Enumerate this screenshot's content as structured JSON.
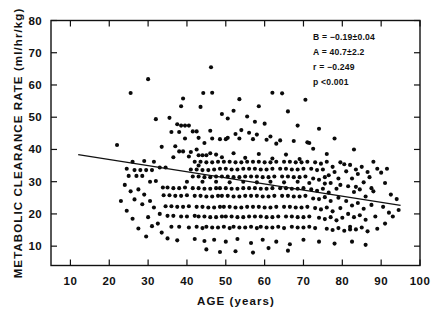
{
  "chart_data": {
    "type": "scatter",
    "title": "",
    "xlabel": "AGE (years)",
    "ylabel": "METABOLIC CLEARANCE RATE (ml/hr/kg)",
    "xlim": [
      5,
      100
    ],
    "ylim": [
      4,
      80
    ],
    "xticks": [
      10,
      20,
      30,
      40,
      50,
      60,
      70,
      80,
      90,
      100
    ],
    "yticks": [
      10,
      20,
      30,
      40,
      50,
      60,
      70,
      80
    ],
    "xtick_labels": [
      "10",
      "20",
      "30",
      "40",
      "50",
      "60",
      "70",
      "80",
      "90",
      "100"
    ],
    "ytick_labels": [
      "10",
      "20",
      "30",
      "40",
      "50",
      "60",
      "70",
      "80"
    ],
    "grid": false,
    "legend": null,
    "tick_direction": "in",
    "annotations": [
      "B  =  −0.19±0.04",
      "A  =  40.7±2.2",
      "r  =  −0.249",
      "p   <0.001"
    ],
    "fit": {
      "type": "linear",
      "slope": -0.19,
      "slope_err": 0.04,
      "intercept": 40.7,
      "intercept_err": 2.2,
      "r": -0.249,
      "p": "<0.001",
      "x_start": 12,
      "x_end": 95
    },
    "marker": {
      "shape": "circle",
      "color": "#0a0a0a",
      "size_px": 3.0
    },
    "n_points": 372,
    "points": [
      [
        22.0,
        41.4
      ],
      [
        25.5,
        57.5
      ],
      [
        30.0,
        61.8
      ],
      [
        32.0,
        49.4
      ],
      [
        46.2,
        65.5
      ],
      [
        39.0,
        55.8
      ],
      [
        38.5,
        53.4
      ],
      [
        44.2,
        57.5
      ],
      [
        46.5,
        57.6
      ],
      [
        43.5,
        53.2
      ],
      [
        35.5,
        49.8
      ],
      [
        37.5,
        47.8
      ],
      [
        38.5,
        47.4
      ],
      [
        39.5,
        47.4
      ],
      [
        40.5,
        47.4
      ],
      [
        36.0,
        45.4
      ],
      [
        38.0,
        45.4
      ],
      [
        41.5,
        45.6
      ],
      [
        42.5,
        45.6
      ],
      [
        46.0,
        45.8
      ],
      [
        33.5,
        40.8
      ],
      [
        37.0,
        41.0
      ],
      [
        38.0,
        39.4
      ],
      [
        39.0,
        39.4
      ],
      [
        41.0,
        39.2
      ],
      [
        42.5,
        40.0
      ],
      [
        43.0,
        38.2
      ],
      [
        44.0,
        38.2
      ],
      [
        45.0,
        38.2
      ],
      [
        47.5,
        38.4
      ],
      [
        44.5,
        42.0
      ],
      [
        48.5,
        43.2
      ],
      [
        50.5,
        43.6
      ],
      [
        52.5,
        44.8
      ],
      [
        54.0,
        46.0
      ],
      [
        56.0,
        45.2
      ],
      [
        58.0,
        44.6
      ],
      [
        60.0,
        48.0
      ],
      [
        61.5,
        44.0
      ],
      [
        63.0,
        41.8
      ],
      [
        49.0,
        51.0
      ],
      [
        50.5,
        49.6
      ],
      [
        52.0,
        52.0
      ],
      [
        55.5,
        50.2
      ],
      [
        57.5,
        48.6
      ],
      [
        53.5,
        55.6
      ],
      [
        58.5,
        53.4
      ],
      [
        62.0,
        57.6
      ],
      [
        64.5,
        57.4
      ],
      [
        66.0,
        51.8
      ],
      [
        70.5,
        55.4
      ],
      [
        74.0,
        46.4
      ],
      [
        78.0,
        43.4
      ],
      [
        83.0,
        40.0
      ],
      [
        88.0,
        36.2
      ],
      [
        68.5,
        47.4
      ],
      [
        71.5,
        42.0
      ],
      [
        72.5,
        40.2
      ],
      [
        76.0,
        38.6
      ],
      [
        80.5,
        35.4
      ],
      [
        24.5,
        34.0
      ],
      [
        26.5,
        33.6
      ],
      [
        28.0,
        33.6
      ],
      [
        29.5,
        33.6
      ],
      [
        31.0,
        33.6
      ],
      [
        25.0,
        31.8
      ],
      [
        27.0,
        31.8
      ],
      [
        28.5,
        31.8
      ],
      [
        30.5,
        30.0
      ],
      [
        32.0,
        30.2
      ],
      [
        26.0,
        36.2
      ],
      [
        29.0,
        36.4
      ],
      [
        31.5,
        36.2
      ],
      [
        33.0,
        34.4
      ],
      [
        34.5,
        34.4
      ],
      [
        33.8,
        28.2
      ],
      [
        35.0,
        28.2
      ],
      [
        36.5,
        28.0
      ],
      [
        38.0,
        28.0
      ],
      [
        39.5,
        28.2
      ],
      [
        34.0,
        25.8
      ],
      [
        35.5,
        25.8
      ],
      [
        37.0,
        25.6
      ],
      [
        38.5,
        25.6
      ],
      [
        40.0,
        25.8
      ],
      [
        34.5,
        22.4
      ],
      [
        36.0,
        22.4
      ],
      [
        37.5,
        22.2
      ],
      [
        39.0,
        22.2
      ],
      [
        40.5,
        22.4
      ],
      [
        35.0,
        19.4
      ],
      [
        36.5,
        19.4
      ],
      [
        38.5,
        19.2
      ],
      [
        40.0,
        19.2
      ],
      [
        42.0,
        19.4
      ],
      [
        36.0,
        16.0
      ],
      [
        38.0,
        16.0
      ],
      [
        40.5,
        15.8
      ],
      [
        42.5,
        16.0
      ],
      [
        44.0,
        15.6
      ],
      [
        41.0,
        33.8
      ],
      [
        42.5,
        33.8
      ],
      [
        44.0,
        33.6
      ],
      [
        45.5,
        33.6
      ],
      [
        47.0,
        33.8
      ],
      [
        41.5,
        31.6
      ],
      [
        43.0,
        31.6
      ],
      [
        44.5,
        31.4
      ],
      [
        46.0,
        31.4
      ],
      [
        47.5,
        31.6
      ],
      [
        42.0,
        36.2
      ],
      [
        43.5,
        36.2
      ],
      [
        45.0,
        36.0
      ],
      [
        46.5,
        36.0
      ],
      [
        48.0,
        36.2
      ],
      [
        41.5,
        28.0
      ],
      [
        43.0,
        28.0
      ],
      [
        44.5,
        27.8
      ],
      [
        46.0,
        27.8
      ],
      [
        47.5,
        28.0
      ],
      [
        42.0,
        25.6
      ],
      [
        43.5,
        25.6
      ],
      [
        45.0,
        25.4
      ],
      [
        46.5,
        25.4
      ],
      [
        48.0,
        25.6
      ],
      [
        42.5,
        22.2
      ],
      [
        44.0,
        22.2
      ],
      [
        45.5,
        22.0
      ],
      [
        47.0,
        22.0
      ],
      [
        48.5,
        22.2
      ],
      [
        43.0,
        19.2
      ],
      [
        44.5,
        19.2
      ],
      [
        46.0,
        19.0
      ],
      [
        47.5,
        19.0
      ],
      [
        49.0,
        19.2
      ],
      [
        45.0,
        16.0
      ],
      [
        46.5,
        15.8
      ],
      [
        48.0,
        15.8
      ],
      [
        49.5,
        16.0
      ],
      [
        51.0,
        15.6
      ],
      [
        48.5,
        34.0
      ],
      [
        50.0,
        34.0
      ],
      [
        51.5,
        33.8
      ],
      [
        53.0,
        33.8
      ],
      [
        54.5,
        34.0
      ],
      [
        49.0,
        31.6
      ],
      [
        50.5,
        31.6
      ],
      [
        52.0,
        31.4
      ],
      [
        53.5,
        31.4
      ],
      [
        55.0,
        31.6
      ],
      [
        49.5,
        36.2
      ],
      [
        51.0,
        36.2
      ],
      [
        52.5,
        36.0
      ],
      [
        54.0,
        36.0
      ],
      [
        55.5,
        36.2
      ],
      [
        48.5,
        28.0
      ],
      [
        50.0,
        28.0
      ],
      [
        51.5,
        27.8
      ],
      [
        53.0,
        27.8
      ],
      [
        54.5,
        28.0
      ],
      [
        49.0,
        25.6
      ],
      [
        50.5,
        25.6
      ],
      [
        52.0,
        25.4
      ],
      [
        53.5,
        25.4
      ],
      [
        55.0,
        25.6
      ],
      [
        49.5,
        22.2
      ],
      [
        51.0,
        22.2
      ],
      [
        52.5,
        22.0
      ],
      [
        54.0,
        22.0
      ],
      [
        55.5,
        22.2
      ],
      [
        50.0,
        19.2
      ],
      [
        51.5,
        19.2
      ],
      [
        53.0,
        19.0
      ],
      [
        54.5,
        19.0
      ],
      [
        56.0,
        19.2
      ],
      [
        52.0,
        16.0
      ],
      [
        53.5,
        15.8
      ],
      [
        55.0,
        15.8
      ],
      [
        56.5,
        16.0
      ],
      [
        58.0,
        15.6
      ],
      [
        56.0,
        34.0
      ],
      [
        57.5,
        34.0
      ],
      [
        59.0,
        33.8
      ],
      [
        60.5,
        33.8
      ],
      [
        62.0,
        34.0
      ],
      [
        56.5,
        31.6
      ],
      [
        58.0,
        31.6
      ],
      [
        59.5,
        31.4
      ],
      [
        61.0,
        31.4
      ],
      [
        62.5,
        31.6
      ],
      [
        57.0,
        36.2
      ],
      [
        58.5,
        36.2
      ],
      [
        60.0,
        36.0
      ],
      [
        61.5,
        36.0
      ],
      [
        63.0,
        36.2
      ],
      [
        56.0,
        28.0
      ],
      [
        57.5,
        28.0
      ],
      [
        59.0,
        27.8
      ],
      [
        60.5,
        27.8
      ],
      [
        62.0,
        28.0
      ],
      [
        56.5,
        25.6
      ],
      [
        58.0,
        25.6
      ],
      [
        59.5,
        25.4
      ],
      [
        61.0,
        25.4
      ],
      [
        62.5,
        25.6
      ],
      [
        57.0,
        22.2
      ],
      [
        58.5,
        22.2
      ],
      [
        60.0,
        22.0
      ],
      [
        61.5,
        22.0
      ],
      [
        63.0,
        22.2
      ],
      [
        57.5,
        19.2
      ],
      [
        59.0,
        19.2
      ],
      [
        60.5,
        19.0
      ],
      [
        62.0,
        19.0
      ],
      [
        63.5,
        19.2
      ],
      [
        59.0,
        16.0
      ],
      [
        60.5,
        15.8
      ],
      [
        62.0,
        15.8
      ],
      [
        63.5,
        16.0
      ],
      [
        65.0,
        15.6
      ],
      [
        64.0,
        34.0
      ],
      [
        65.5,
        34.0
      ],
      [
        67.0,
        33.8
      ],
      [
        68.5,
        33.8
      ],
      [
        70.0,
        34.0
      ],
      [
        64.5,
        31.6
      ],
      [
        66.0,
        31.6
      ],
      [
        67.5,
        31.4
      ],
      [
        69.0,
        31.4
      ],
      [
        70.5,
        31.6
      ],
      [
        65.0,
        36.2
      ],
      [
        66.5,
        36.2
      ],
      [
        68.0,
        36.0
      ],
      [
        69.5,
        36.0
      ],
      [
        71.0,
        36.2
      ],
      [
        64.0,
        28.0
      ],
      [
        65.5,
        28.0
      ],
      [
        67.0,
        27.8
      ],
      [
        68.5,
        27.8
      ],
      [
        70.0,
        28.0
      ],
      [
        64.5,
        25.6
      ],
      [
        66.0,
        25.6
      ],
      [
        67.5,
        25.4
      ],
      [
        69.0,
        25.4
      ],
      [
        70.5,
        25.6
      ],
      [
        65.0,
        22.2
      ],
      [
        66.5,
        22.2
      ],
      [
        68.0,
        22.0
      ],
      [
        69.5,
        22.0
      ],
      [
        71.0,
        22.2
      ],
      [
        65.5,
        19.2
      ],
      [
        67.0,
        19.2
      ],
      [
        68.5,
        19.0
      ],
      [
        70.0,
        19.0
      ],
      [
        71.5,
        19.2
      ],
      [
        67.0,
        16.0
      ],
      [
        68.5,
        15.8
      ],
      [
        70.0,
        15.8
      ],
      [
        71.5,
        16.0
      ],
      [
        73.0,
        15.6
      ],
      [
        72.0,
        34.0
      ],
      [
        73.5,
        33.6
      ],
      [
        75.0,
        33.8
      ],
      [
        76.5,
        32.0
      ],
      [
        78.0,
        33.0
      ],
      [
        72.5,
        31.0
      ],
      [
        74.0,
        30.6
      ],
      [
        75.5,
        31.4
      ],
      [
        77.0,
        29.6
      ],
      [
        79.0,
        31.0
      ],
      [
        73.0,
        36.0
      ],
      [
        74.5,
        35.6
      ],
      [
        76.0,
        36.2
      ],
      [
        77.5,
        34.6
      ],
      [
        79.5,
        36.0
      ],
      [
        72.0,
        27.6
      ],
      [
        73.5,
        27.2
      ],
      [
        75.0,
        27.8
      ],
      [
        76.5,
        26.6
      ],
      [
        78.5,
        27.8
      ],
      [
        72.5,
        24.8
      ],
      [
        74.0,
        24.6
      ],
      [
        75.5,
        25.2
      ],
      [
        77.0,
        24.0
      ],
      [
        79.0,
        25.0
      ],
      [
        73.0,
        21.8
      ],
      [
        74.5,
        21.4
      ],
      [
        76.0,
        22.0
      ],
      [
        77.5,
        20.8
      ],
      [
        79.5,
        21.8
      ],
      [
        74.0,
        18.8
      ],
      [
        75.5,
        18.4
      ],
      [
        77.0,
        19.0
      ],
      [
        78.5,
        18.0
      ],
      [
        80.0,
        18.8
      ],
      [
        76.0,
        15.4
      ],
      [
        77.5,
        15.0
      ],
      [
        79.0,
        15.6
      ],
      [
        80.5,
        14.8
      ],
      [
        82.0,
        15.2
      ],
      [
        81.0,
        33.2
      ],
      [
        82.5,
        31.0
      ],
      [
        84.0,
        32.4
      ],
      [
        85.5,
        29.8
      ],
      [
        87.0,
        31.4
      ],
      [
        81.5,
        28.6
      ],
      [
        83.0,
        26.8
      ],
      [
        84.5,
        27.6
      ],
      [
        86.0,
        25.4
      ],
      [
        88.0,
        27.0
      ],
      [
        82.0,
        35.2
      ],
      [
        83.5,
        33.8
      ],
      [
        85.0,
        34.6
      ],
      [
        86.5,
        33.0
      ],
      [
        89.0,
        34.0
      ],
      [
        81.0,
        24.0
      ],
      [
        82.5,
        22.6
      ],
      [
        84.0,
        23.4
      ],
      [
        85.5,
        21.6
      ],
      [
        87.5,
        22.8
      ],
      [
        81.5,
        20.0
      ],
      [
        83.0,
        19.0
      ],
      [
        84.5,
        19.6
      ],
      [
        86.0,
        18.2
      ],
      [
        88.5,
        19.2
      ],
      [
        82.0,
        16.0
      ],
      [
        83.5,
        15.2
      ],
      [
        85.0,
        15.8
      ],
      [
        86.5,
        14.6
      ],
      [
        89.0,
        15.4
      ],
      [
        91.0,
        29.6
      ],
      [
        92.5,
        26.0
      ],
      [
        94.0,
        24.6
      ],
      [
        90.5,
        22.2
      ],
      [
        92.0,
        20.4
      ],
      [
        90.0,
        32.8
      ],
      [
        91.5,
        34.0
      ],
      [
        93.0,
        19.2
      ],
      [
        94.5,
        21.2
      ],
      [
        91.0,
        17.0
      ],
      [
        29.0,
        26.0
      ],
      [
        30.5,
        24.0
      ],
      [
        31.5,
        22.0
      ],
      [
        33.0,
        20.0
      ],
      [
        32.5,
        17.0
      ],
      [
        27.5,
        27.6
      ],
      [
        28.5,
        23.0
      ],
      [
        30.0,
        19.0
      ],
      [
        31.0,
        16.2
      ],
      [
        33.5,
        14.2
      ],
      [
        24.0,
        29.0
      ],
      [
        25.5,
        27.0
      ],
      [
        26.5,
        24.5
      ],
      [
        23.0,
        24.0
      ],
      [
        24.5,
        21.0
      ],
      [
        26.0,
        18.5
      ],
      [
        27.5,
        15.5
      ],
      [
        29.5,
        13.0
      ],
      [
        35.0,
        12.4
      ],
      [
        37.5,
        11.8
      ],
      [
        42.0,
        12.2
      ],
      [
        44.5,
        11.6
      ],
      [
        47.0,
        12.0
      ],
      [
        50.0,
        11.4
      ],
      [
        53.0,
        12.2
      ],
      [
        56.5,
        11.0
      ],
      [
        59.5,
        12.0
      ],
      [
        63.0,
        11.4
      ],
      [
        66.5,
        10.6
      ],
      [
        70.0,
        12.0
      ],
      [
        74.0,
        11.4
      ],
      [
        78.0,
        10.8
      ],
      [
        82.5,
        11.4
      ],
      [
        86.0,
        10.4
      ],
      [
        61.0,
        9.4
      ],
      [
        52.5,
        8.4
      ],
      [
        57.0,
        8.0
      ],
      [
        66.0,
        8.6
      ],
      [
        45.0,
        9.0
      ],
      [
        48.5,
        8.2
      ],
      [
        40.0,
        30.0
      ],
      [
        40.5,
        37.8
      ],
      [
        44.0,
        30.0
      ],
      [
        47.5,
        30.0
      ],
      [
        51.0,
        29.8
      ],
      [
        54.5,
        30.0
      ],
      [
        58.0,
        29.8
      ],
      [
        61.5,
        30.0
      ],
      [
        65.0,
        29.8
      ],
      [
        68.5,
        30.0
      ],
      [
        71.5,
        29.6
      ],
      [
        75.5,
        29.4
      ],
      [
        79.5,
        29.0
      ],
      [
        83.5,
        28.4
      ],
      [
        87.5,
        28.0
      ],
      [
        39.5,
        43.4
      ],
      [
        43.0,
        43.6
      ],
      [
        46.5,
        43.4
      ],
      [
        50.0,
        43.2
      ],
      [
        53.5,
        43.4
      ],
      [
        57.0,
        43.2
      ],
      [
        60.5,
        43.0
      ],
      [
        64.0,
        42.8
      ],
      [
        67.5,
        42.6
      ],
      [
        71.0,
        42.2
      ],
      [
        36.5,
        37.6
      ],
      [
        43.0,
        35.0
      ],
      [
        46.0,
        38.8
      ],
      [
        49.0,
        37.6
      ],
      [
        52.0,
        38.8
      ],
      [
        55.0,
        37.4
      ],
      [
        58.5,
        38.6
      ],
      [
        62.0,
        37.2
      ],
      [
        65.5,
        38.4
      ],
      [
        69.0,
        37.0
      ]
    ]
  }
}
